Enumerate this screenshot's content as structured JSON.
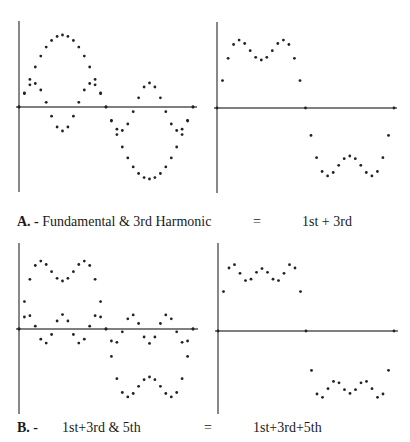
{
  "captions": {
    "a": {
      "letter": "A. -",
      "left_text": "Fundamental & 3rd Harmonic",
      "equals": "=",
      "right_text": "1st + 3rd"
    },
    "b": {
      "letter": "B. -",
      "left_text": "1st+3rd & 5th",
      "equals": "=",
      "right_text": "1st+3rd+5th"
    }
  },
  "colors": {
    "axis": "#555555",
    "dot": "#222222",
    "background": "#ffffff"
  },
  "chart_data": [
    {
      "id": "A-left",
      "type": "scatter",
      "title": "Fundamental & 3rd Harmonic",
      "xlabel": "",
      "ylabel": "",
      "grid": false,
      "samples_per_period": 33,
      "x_range": [
        0,
        6.2832
      ],
      "series": [
        {
          "name": "Fundamental",
          "harmonics": [
            [
              1,
              1.0
            ]
          ]
        },
        {
          "name": "3rd Harmonic",
          "harmonics": [
            [
              3,
              0.3333
            ]
          ]
        }
      ]
    },
    {
      "id": "A-right",
      "type": "scatter",
      "title": "1st + 3rd",
      "xlabel": "",
      "ylabel": "",
      "grid": false,
      "samples_per_period": 33,
      "x_range": [
        0,
        6.2832
      ],
      "series": [
        {
          "name": "1st + 3rd",
          "harmonics": [
            [
              1,
              1.0
            ],
            [
              3,
              0.3333
            ]
          ]
        }
      ]
    },
    {
      "id": "B-left",
      "type": "scatter",
      "title": "1st+3rd & 5th",
      "xlabel": "",
      "ylabel": "",
      "grid": false,
      "samples_per_period": 33,
      "x_range": [
        0,
        6.2832
      ],
      "series": [
        {
          "name": "1st+3rd",
          "harmonics": [
            [
              1,
              1.0
            ],
            [
              3,
              0.3333
            ]
          ]
        },
        {
          "name": "5th Harmonic",
          "harmonics": [
            [
              5,
              0.2
            ]
          ]
        }
      ]
    },
    {
      "id": "B-right",
      "type": "scatter",
      "title": "1st+3rd+5th",
      "xlabel": "",
      "ylabel": "",
      "grid": false,
      "samples_per_period": 33,
      "x_range": [
        0,
        6.2832
      ],
      "series": [
        {
          "name": "1st+3rd+5th",
          "harmonics": [
            [
              1,
              1.0
            ],
            [
              3,
              0.3333
            ],
            [
              5,
              0.2
            ]
          ]
        }
      ]
    }
  ]
}
